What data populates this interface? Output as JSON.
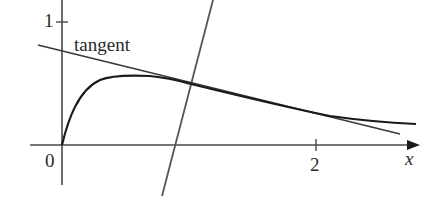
{
  "diagram": {
    "title": "",
    "labels": {
      "tangent": "tangent",
      "y_tick_1": "1",
      "origin": "0",
      "x_tick_2": "2",
      "x_axis": "x"
    },
    "colors": {
      "curve": "#1a1a1a",
      "axes": "#4a4a4a",
      "tangent_line": "#3a3a3a",
      "normal_line": "#555555",
      "text": "#2a2a2a"
    },
    "elements": [
      {
        "id": "curve",
        "description": "concave curve starting at origin, rising to max near x≈0.6, then decaying"
      },
      {
        "id": "tangent-line",
        "description": "tangent line to the curve at point near x≈1.2"
      },
      {
        "id": "normal-line",
        "description": "steep line through the tangency point (normal line)"
      },
      {
        "id": "x-axis",
        "description": "horizontal axis with arrow, tick at 2"
      },
      {
        "id": "y-axis",
        "description": "vertical axis with tick at 1"
      }
    ]
  }
}
